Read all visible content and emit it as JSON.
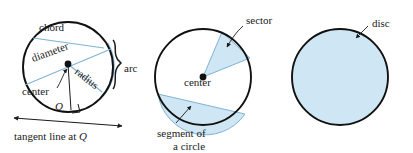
{
  "figure": {
    "background_color": "#ffffff",
    "outline_color": "#111111",
    "fill_color": "#cfe6f4",
    "accent_line_color": "#7fb3d5",
    "text_color": "#1a1a1a"
  },
  "diagrams": [
    {
      "id": "circle-parts",
      "name": "circle-with-parts",
      "center": [
        68,
        67
      ],
      "radius": 45,
      "labels": {
        "chord": "chord",
        "diameter": "diameter",
        "radius": "radius",
        "center": "center",
        "arc": "arc",
        "point_q": "Q",
        "tangent": "tangent line at Q",
        "tangent_prefix": "tangent line at ",
        "tangent_point": "Q"
      }
    },
    {
      "id": "sector-segment",
      "name": "circle-with-sector-and-segment",
      "center": [
        203,
        77
      ],
      "radius": 48,
      "labels": {
        "sector": "sector",
        "center": "center",
        "segment_line1": "segment of",
        "segment_line2": "a circle"
      }
    },
    {
      "id": "disc",
      "name": "filled-disc",
      "center": [
        340,
        77
      ],
      "radius": 48,
      "labels": {
        "disc": "disc"
      }
    }
  ]
}
